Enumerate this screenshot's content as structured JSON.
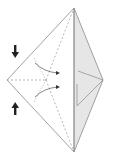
{
  "diagram": {
    "type": "origami-fold-step",
    "colors": {
      "background": "#ffffff",
      "outline": "#8a8a8a",
      "paper_back": "#e6e6e6",
      "crease": "#9a9a9a",
      "arrow": "#222222"
    },
    "vertices": {
      "top": [
        74,
        8
      ],
      "left": [
        7,
        80
      ],
      "right": [
        103,
        80
      ],
      "bottom": [
        74,
        152
      ],
      "center": [
        46,
        80
      ]
    },
    "arrows": [
      {
        "name": "push-down-arrow",
        "direction": "down",
        "at": [
          15,
          52
        ]
      },
      {
        "name": "push-up-arrow",
        "direction": "up",
        "at": [
          15,
          108
        ]
      }
    ]
  }
}
